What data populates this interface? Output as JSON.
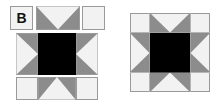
{
  "diagram": {
    "title_label": "B",
    "colors": {
      "light": "#f2f2f2",
      "gray": "#8c8c8c",
      "dark": "#000000",
      "outline": "#9a9a9a"
    },
    "exploded": {
      "top_row": [
        "label-square",
        "flying-geese-down",
        "plain-square"
      ],
      "middle_row": [
        "flying-geese-right",
        "center-square",
        "flying-geese-left"
      ],
      "bottom_row": [
        "plain-square",
        "flying-geese-up",
        "plain-square"
      ]
    },
    "assembled": {
      "grid": "4x4 units: 4 corner squares, 4 flying-geese units, 1 center square"
    }
  }
}
